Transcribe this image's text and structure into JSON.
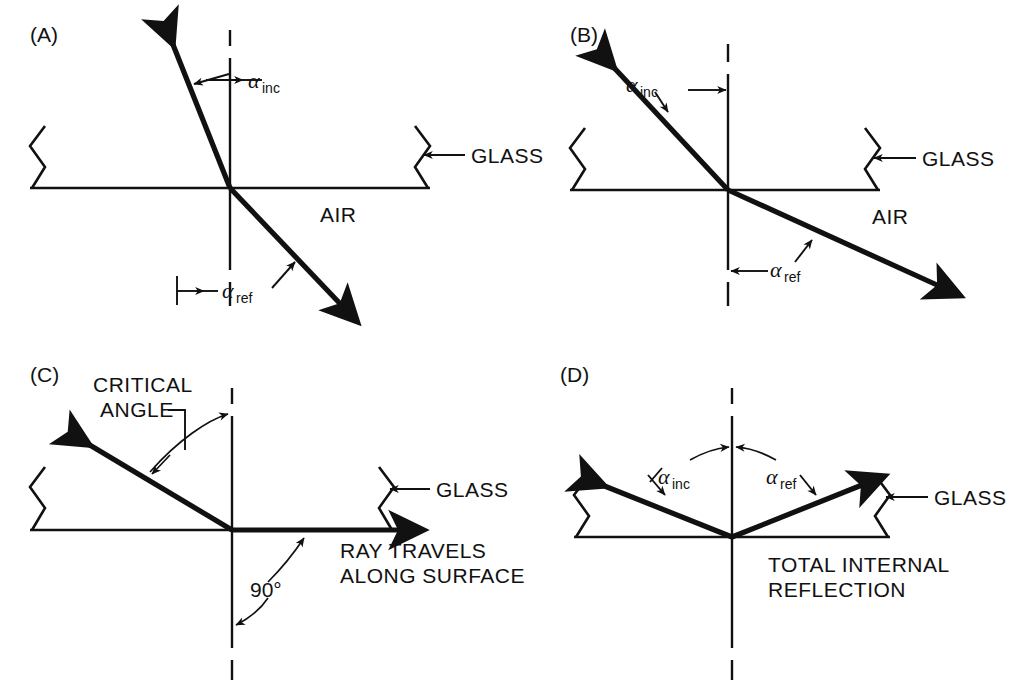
{
  "figure": {
    "type": "optics-diagram",
    "background": "#ffffff",
    "ink": "#111111"
  },
  "panels": [
    {
      "id": "A",
      "label": "(A)",
      "medium_upper": "GLASS",
      "medium_lower": "AIR",
      "glass_label": "GLASS",
      "air_label": "AIR",
      "angles": [
        {
          "name": "alpha_inc",
          "symbol": "α",
          "subscript": "inc"
        },
        {
          "name": "alpha_ref",
          "symbol": "α",
          "subscript": "ref"
        }
      ]
    },
    {
      "id": "B",
      "label": "(B)",
      "medium_upper": "GLASS",
      "medium_lower": "AIR",
      "glass_label": "GLASS",
      "air_label": "AIR",
      "angles": [
        {
          "name": "alpha_inc",
          "symbol": "α",
          "subscript": "inc"
        },
        {
          "name": "alpha_ref",
          "symbol": "α",
          "subscript": "ref"
        }
      ]
    },
    {
      "id": "C",
      "label": "(C)",
      "glass_label": "GLASS",
      "critical_angle_label_line1": "CRITICAL",
      "critical_angle_label_line2": "ANGLE",
      "right_angle_label": "90°",
      "surface_ray_label_line1": "RAY TRAVELS",
      "surface_ray_label_line2": "ALONG SURFACE"
    },
    {
      "id": "D",
      "label": "(D)",
      "glass_label": "GLASS",
      "reflection_label_line1": "TOTAL INTERNAL",
      "reflection_label_line2": "REFLECTION",
      "angles": [
        {
          "name": "alpha_inc",
          "symbol": "α",
          "subscript": "inc"
        },
        {
          "name": "alpha_ref",
          "symbol": "α",
          "subscript": "ref"
        }
      ]
    }
  ],
  "symbols": {
    "alpha": "α",
    "inc": "inc",
    "ref": "ref",
    "degree_90": "90°"
  }
}
